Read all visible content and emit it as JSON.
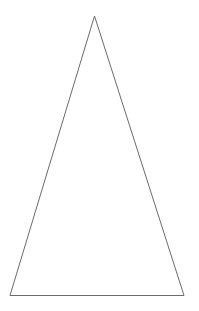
{
  "diagram": {
    "shape": "triangle",
    "variant": "isosceles",
    "fill": "none",
    "stroke_color": "#6b6b6b",
    "stroke_width": 1,
    "background": "#ffffff",
    "vertices": {
      "apex": {
        "x": 94.5,
        "y": 16
      },
      "bottom_left": {
        "x": 10,
        "y": 295.5
      },
      "bottom_right": {
        "x": 184,
        "y": 295.5
      }
    }
  }
}
